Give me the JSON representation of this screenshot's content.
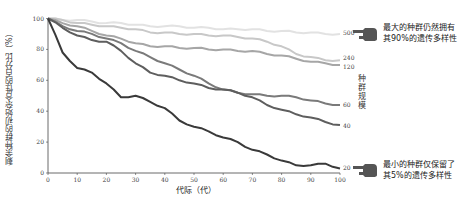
{
  "chart_data": {
    "type": "line",
    "title": "",
    "xlabel": "代际（代）",
    "ylabel": "剩余种群的初始杂合性的百分比（%）",
    "xlim": [
      0,
      100
    ],
    "ylim": [
      0,
      100
    ],
    "xticks": [
      "0",
      "10",
      "20",
      "30",
      "40",
      "50",
      "60",
      "70",
      "80",
      "90",
      "100"
    ],
    "yticks": [
      "0",
      "20",
      "40",
      "60",
      "80",
      "100"
    ],
    "grid": false,
    "legend_title": "种群规模",
    "x": [
      0,
      5,
      10,
      15,
      20,
      25,
      30,
      35,
      40,
      45,
      50,
      55,
      60,
      65,
      70,
      75,
      80,
      85,
      90,
      95,
      100
    ],
    "series": [
      {
        "name": "500",
        "color": "#e2e2e2",
        "values": [
          100,
          99,
          99,
          98,
          97,
          97,
          96,
          95,
          95,
          95,
          94,
          94,
          93,
          93,
          93,
          92,
          92,
          91,
          91,
          90,
          90
        ]
      },
      {
        "name": "240",
        "color": "#c8c8c8",
        "values": [
          100,
          99,
          97,
          96,
          95,
          94,
          93,
          91,
          91,
          90,
          90,
          89,
          89,
          88,
          87,
          85,
          82,
          77,
          75,
          73,
          73
        ]
      },
      {
        "name": "120",
        "color": "#a6a6a6",
        "values": [
          100,
          97,
          95,
          92,
          89,
          87,
          84,
          82,
          82,
          81,
          81,
          80,
          80,
          79,
          79,
          77,
          76,
          74,
          72,
          71,
          70
        ]
      },
      {
        "name": "60",
        "color": "#7a7a7a",
        "values": [
          100,
          95,
          92,
          90,
          87,
          84,
          79,
          75,
          71,
          67,
          63,
          58,
          54,
          52,
          51,
          50,
          50,
          49,
          47,
          45,
          44
        ]
      },
      {
        "name": "40",
        "color": "#5e5e5e",
        "values": [
          100,
          94,
          89,
          86,
          85,
          79,
          71,
          65,
          63,
          60,
          58,
          55,
          54,
          52,
          49,
          44,
          41,
          38,
          36,
          33,
          31
        ]
      },
      {
        "name": "20",
        "color": "#3a3a3a",
        "values": [
          100,
          78,
          68,
          65,
          58,
          49,
          50,
          46,
          42,
          34,
          30,
          27,
          23,
          20,
          15,
          12,
          8,
          5,
          5,
          6,
          3
        ]
      }
    ],
    "annotations": [
      {
        "series": "500",
        "text_lines": [
          "最大的种群仍然拥有",
          "其90%的遗传多样性"
        ]
      },
      {
        "series": "20",
        "text_lines": [
          "最小的种群仅保留了",
          "其5%的遗传多样性"
        ]
      }
    ]
  },
  "annotations": {
    "top": {
      "line1": "最大的种群仍然拥有",
      "line2": "其90%的遗传多样性",
      "icon": "pointing-hand-icon"
    },
    "bottom": {
      "line1": "最小的种群仅保留了",
      "line2": "其5%的遗传多样性",
      "icon": "pointing-hand-icon"
    }
  },
  "labels": {
    "legend_title": "种群规模",
    "xlabel": "代际（代）",
    "ylabel": "剩余种群的初始杂合性的百分比（%）"
  }
}
